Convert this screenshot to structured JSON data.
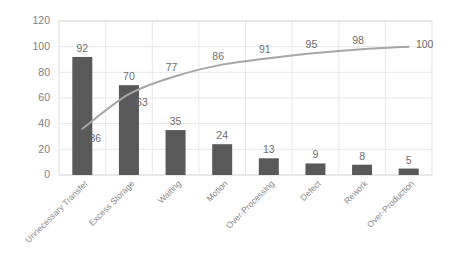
{
  "chart_data": {
    "type": "bar",
    "title": "",
    "subtitle": "",
    "xlabel": "",
    "ylabel": "",
    "ylim": [
      0,
      120
    ],
    "yticks": [
      0,
      20,
      40,
      60,
      80,
      100,
      120
    ],
    "grid": true,
    "legend": false,
    "legend_position": "none",
    "categories": [
      "Unnecessary Transfer",
      "Excess Storage",
      "Waiting",
      "Motion",
      "Over-Processing",
      "Defect",
      "Rework",
      "Over-Production"
    ],
    "series": [
      {
        "name": "Count",
        "type": "bar",
        "color": "#595959",
        "values": [
          92,
          70,
          35,
          24,
          13,
          9,
          8,
          5
        ],
        "labels": [
          "92",
          "70",
          "35",
          "24",
          "13",
          "9",
          "8",
          "5"
        ]
      },
      {
        "name": "Cumulative %",
        "type": "line",
        "color": "#a6a6a6",
        "values": [
          36,
          63,
          77,
          86,
          91,
          95,
          98,
          100
        ],
        "labels": [
          "36",
          "63",
          "77",
          "86",
          "91",
          "95",
          "98",
          "100"
        ]
      }
    ]
  },
  "axis": {
    "y_tick_labels": [
      "120",
      "100",
      "80",
      "60",
      "40",
      "20",
      "0"
    ]
  },
  "colors": {
    "bar": "#595959",
    "line": "#a6a6a6",
    "grid": "#e2e2e2",
    "tick_text": "#808080",
    "category_text": "#8a8a8a",
    "data_label_text": "#6e6e6e",
    "background": "#ffffff"
  }
}
